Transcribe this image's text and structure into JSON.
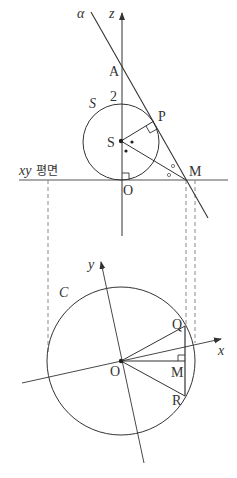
{
  "figure": {
    "top_view": {
      "labels": {
        "alpha": "α",
        "z_axis": "z",
        "A": "A",
        "two": "2",
        "S_sphere": "S",
        "P": "P",
        "S_center": "S",
        "xy_plane_prefix": "xy",
        "xy_plane_suffix": "평면",
        "M": "M",
        "O": "O"
      },
      "points": {
        "O": [
          121,
          180
        ],
        "S": [
          121,
          141
        ],
        "P": [
          154,
          121
        ],
        "M": [
          186,
          180
        ],
        "A": [
          121,
          70
        ]
      },
      "sphere_radius": 38
    },
    "bottom_view": {
      "labels": {
        "C": "C",
        "y_axis": "y",
        "x_axis": "x",
        "O": "O",
        "Q": "Q",
        "M": "M",
        "R": "R"
      },
      "points": {
        "O": [
          121,
          361
        ],
        "Q": [
          185,
          326
        ],
        "M": [
          185,
          361
        ],
        "R": [
          185,
          396
        ]
      },
      "circle_radius": 74
    },
    "colors": {
      "stroke": "#333333",
      "dashed": "#888888",
      "background": "#ffffff"
    }
  }
}
